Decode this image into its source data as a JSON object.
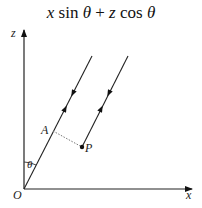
{
  "title": {
    "parts": [
      "x",
      " sin ",
      "θ",
      " + ",
      "z",
      " cos ",
      "θ"
    ]
  },
  "labels": {
    "z_axis": "z",
    "x_axis": "x",
    "origin": "O",
    "point_a": "A",
    "point_p": "P",
    "angle": "θ"
  },
  "colors": {
    "line": "#222222",
    "dotted": "#777777",
    "background": "#ffffff"
  }
}
